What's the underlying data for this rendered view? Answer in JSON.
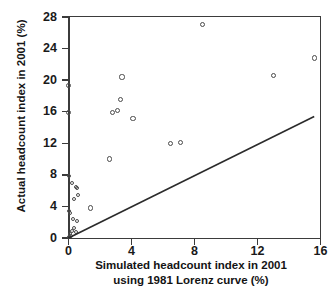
{
  "chart_data": {
    "type": "scatter",
    "title": "",
    "xlabel": "Simulated headcount index in 2001 using 1981 Lorenz curve (%)",
    "xlabel_line1": "Simulated headcount index in 2001",
    "xlabel_line2": "using 1981 Lorenz curve (%)",
    "ylabel": "Actual headcount index in 2001 (%)",
    "xlim": [
      0,
      16
    ],
    "ylim": [
      0,
      28
    ],
    "xticks": [
      0,
      4,
      8,
      12,
      16
    ],
    "yticks": [
      0,
      4,
      8,
      12,
      16,
      20,
      24,
      28
    ],
    "xtick_labels": [
      "0",
      "4",
      "8",
      "12",
      "16"
    ],
    "ytick_labels": [
      "0",
      "4",
      "8",
      "12",
      "16",
      "20",
      "24",
      "28"
    ],
    "grid": false,
    "legend": null,
    "marker": "open-circle",
    "marker_color": "#4a4a4a",
    "line_color": "#2b2b2b",
    "points": [
      {
        "x": 8.5,
        "y": 27.0
      },
      {
        "x": 15.6,
        "y": 22.8
      },
      {
        "x": 13.0,
        "y": 20.6
      },
      {
        "x": 3.4,
        "y": 20.4
      },
      {
        "x": 0.0,
        "y": 19.3
      },
      {
        "x": 3.3,
        "y": 17.5
      },
      {
        "x": 3.1,
        "y": 16.2
      },
      {
        "x": 2.8,
        "y": 15.9
      },
      {
        "x": 0.0,
        "y": 15.9
      },
      {
        "x": 4.1,
        "y": 15.1
      },
      {
        "x": 7.1,
        "y": 12.1
      },
      {
        "x": 6.5,
        "y": 12.0
      },
      {
        "x": 2.6,
        "y": 10.0
      },
      {
        "x": 0.05,
        "y": 7.8
      },
      {
        "x": 0.2,
        "y": 7.0
      },
      {
        "x": 0.45,
        "y": 6.5
      },
      {
        "x": 0.55,
        "y": 6.3
      },
      {
        "x": 0.6,
        "y": 5.4
      },
      {
        "x": 0.35,
        "y": 5.0
      },
      {
        "x": 1.4,
        "y": 3.8
      },
      {
        "x": 0.05,
        "y": 3.4
      },
      {
        "x": 0.1,
        "y": 3.2
      },
      {
        "x": 0.3,
        "y": 2.4
      },
      {
        "x": 0.55,
        "y": 2.2
      },
      {
        "x": 0.35,
        "y": 1.3
      },
      {
        "x": 0.2,
        "y": 0.9
      },
      {
        "x": 0.45,
        "y": 0.8
      },
      {
        "x": 0.08,
        "y": 0.5
      },
      {
        "x": 0.15,
        "y": 0.25
      },
      {
        "x": 0.02,
        "y": 0.1
      }
    ],
    "reference_line": {
      "name": "45-degree-identity-reference",
      "x0": 0.0,
      "y0": 0.0,
      "x1": 15.6,
      "y1": 15.4
    }
  }
}
